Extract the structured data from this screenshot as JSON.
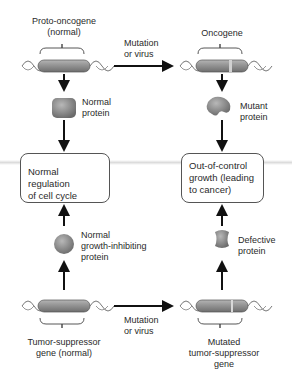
{
  "diagram": {
    "top_left": {
      "gene_label_line1": "Proto-oncogene",
      "gene_label_line2": "(normal)",
      "protein_label_line1": "Normal",
      "protein_label_line2": "protein"
    },
    "top_right": {
      "gene_label": "Oncogene",
      "protein_label_line1": "Mutant",
      "protein_label_line2": "protein"
    },
    "top_arrow": {
      "line1": "Mutation",
      "line2": "or virus"
    },
    "middle_left_box": {
      "line1": "Normal regulation",
      "line2": "of cell cycle"
    },
    "middle_right_box": {
      "line1": "Out-of-control",
      "line2": "growth (leading",
      "line3": "to cancer)"
    },
    "bottom_left": {
      "protein_label_line1": "Normal",
      "protein_label_line2": "growth-inhibiting",
      "protein_label_line3": "protein",
      "gene_label_line1": "Tumor-suppressor",
      "gene_label_line2": "gene (normal)"
    },
    "bottom_right": {
      "protein_label_line1": "Defective",
      "protein_label_line2": "protein",
      "gene_label_line1": "Mutated",
      "gene_label_line2": "tumor-suppressor",
      "gene_label_line3": "gene"
    },
    "bottom_arrow": {
      "line1": "Mutation",
      "line2": "or virus"
    }
  },
  "colors": {
    "gene_body": "#8a8a8a",
    "protein": "#8f8f8f",
    "arrow": "#111111",
    "box_border": "#555555"
  }
}
